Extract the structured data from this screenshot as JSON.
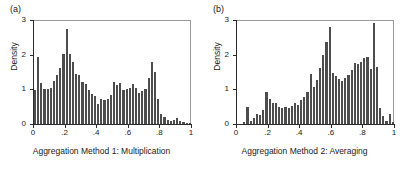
{
  "figure": {
    "background": "#ffffff",
    "bar_color": "#4d4d4d",
    "axis_color": "#2b2b2b"
  },
  "chart_data": [
    {
      "type": "bar",
      "panel": "(a)",
      "title": "",
      "xlabel": "Aggregation Method 1: Multiplication",
      "ylabel": "Density",
      "xlim": [
        0,
        1
      ],
      "ylim": [
        0,
        3
      ],
      "xticks": [
        0,
        0.2,
        0.4,
        0.6,
        0.8,
        1
      ],
      "xticklabels": [
        "0",
        ".2",
        ".4",
        ".6",
        ".8",
        "1"
      ],
      "yticks": [
        0,
        1,
        2,
        3
      ],
      "yticklabels": [
        "0",
        "1",
        "2",
        "3"
      ],
      "grid": false,
      "legend": null,
      "bin_width": 0.02,
      "bin_starts": [
        0.0,
        0.02,
        0.04,
        0.06,
        0.08,
        0.1,
        0.12,
        0.14,
        0.16,
        0.18,
        0.2,
        0.22,
        0.24,
        0.26,
        0.28,
        0.3,
        0.32,
        0.34,
        0.36,
        0.38,
        0.4,
        0.42,
        0.44,
        0.46,
        0.48,
        0.5,
        0.52,
        0.54,
        0.56,
        0.58,
        0.6,
        0.62,
        0.64,
        0.66,
        0.68,
        0.7,
        0.72,
        0.74,
        0.76,
        0.78,
        0.8,
        0.82,
        0.84,
        0.86,
        0.88,
        0.9,
        0.92,
        0.94,
        0.96,
        0.98
      ],
      "values": [
        0.98,
        1.93,
        1.17,
        1.0,
        1.02,
        1.03,
        1.25,
        1.42,
        1.62,
        2.02,
        2.74,
        2.03,
        1.78,
        1.45,
        1.42,
        1.22,
        1.14,
        0.98,
        0.88,
        0.8,
        0.57,
        0.73,
        0.7,
        0.72,
        0.85,
        1.22,
        1.12,
        1.18,
        0.97,
        1.0,
        1.05,
        1.16,
        1.04,
        0.9,
        0.95,
        1.0,
        1.34,
        1.78,
        1.5,
        0.72,
        0.3,
        0.2,
        0.12,
        0.1,
        0.12,
        0.16,
        0.1,
        0.05,
        0.04,
        0.02
      ]
    },
    {
      "type": "bar",
      "panel": "(b)",
      "title": "",
      "xlabel": "Aggregation Method 2: Averaging",
      "ylabel": "Density",
      "xlim": [
        0,
        1
      ],
      "ylim": [
        0,
        3
      ],
      "xticks": [
        0,
        0.2,
        0.4,
        0.6,
        0.8,
        1
      ],
      "xticklabels": [
        "0",
        ".2",
        ".4",
        ".6",
        ".8",
        "1"
      ],
      "yticks": [
        0,
        1,
        2,
        3
      ],
      "yticklabels": [
        "0",
        "1",
        "2",
        "3"
      ],
      "grid": false,
      "legend": null,
      "bin_width": 0.02,
      "bin_starts": [
        0.0,
        0.02,
        0.04,
        0.06,
        0.08,
        0.1,
        0.12,
        0.14,
        0.16,
        0.18,
        0.2,
        0.22,
        0.24,
        0.26,
        0.28,
        0.3,
        0.32,
        0.34,
        0.36,
        0.38,
        0.4,
        0.42,
        0.44,
        0.46,
        0.48,
        0.5,
        0.52,
        0.54,
        0.56,
        0.58,
        0.6,
        0.62,
        0.64,
        0.66,
        0.68,
        0.7,
        0.72,
        0.74,
        0.76,
        0.78,
        0.8,
        0.82,
        0.84,
        0.86,
        0.88,
        0.9,
        0.92,
        0.94,
        0.96,
        0.98
      ],
      "values": [
        0.0,
        0.0,
        0.06,
        0.49,
        0.1,
        0.17,
        0.3,
        0.25,
        0.4,
        0.92,
        0.72,
        0.62,
        0.6,
        0.48,
        0.45,
        0.5,
        0.46,
        0.52,
        0.62,
        0.55,
        0.7,
        0.78,
        0.92,
        1.44,
        1.08,
        1.28,
        1.62,
        2.0,
        2.36,
        2.81,
        1.48,
        1.38,
        1.3,
        1.23,
        1.32,
        1.42,
        1.55,
        1.75,
        1.72,
        1.78,
        1.9,
        1.93,
        1.58,
        2.92,
        1.65,
        0.45,
        0.22,
        0.1,
        0.28,
        0.05
      ]
    }
  ]
}
